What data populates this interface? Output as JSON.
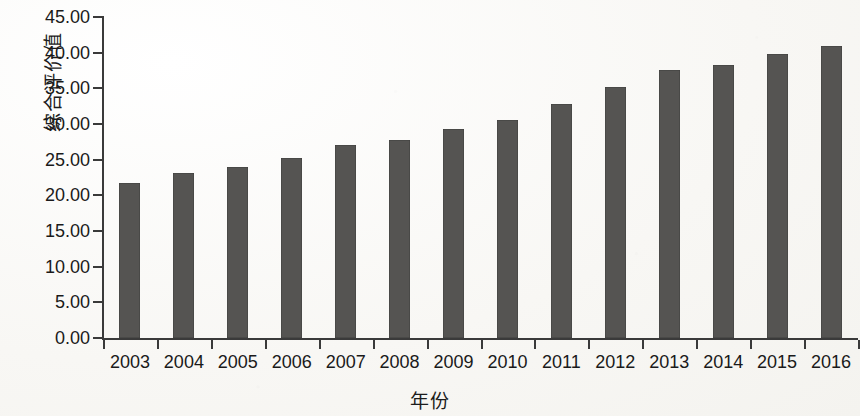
{
  "chart_data": {
    "type": "bar",
    "title": "",
    "xlabel": "年份",
    "ylabel": "综合评价值",
    "categories": [
      "2003",
      "2004",
      "2005",
      "2006",
      "2007",
      "2008",
      "2009",
      "2010",
      "2011",
      "2012",
      "2013",
      "2014",
      "2015",
      "2016"
    ],
    "values": [
      21.7,
      23.1,
      24.0,
      25.2,
      27.0,
      27.8,
      29.3,
      30.6,
      32.8,
      35.2,
      37.6,
      38.3,
      39.8,
      41.0
    ],
    "series": [
      {
        "name": "综合评价值",
        "values": [
          21.7,
          23.1,
          24.0,
          25.2,
          27.0,
          27.8,
          29.3,
          30.6,
          32.8,
          35.2,
          37.6,
          38.3,
          39.8,
          41.0
        ]
      }
    ],
    "ylim": [
      0,
      45
    ],
    "ytick_step": 5,
    "ytick_labels": [
      "0.00",
      "5.00",
      "10.00",
      "15.00",
      "20.00",
      "25.00",
      "30.00",
      "35.00",
      "40.00",
      "45.00"
    ],
    "ytick_values": [
      0,
      5,
      10,
      15,
      20,
      25,
      30,
      35,
      40,
      45
    ],
    "grid": false,
    "legend": false,
    "legend_position": "none",
    "bar_color": "#555452",
    "axis_color": "#3a3a3a",
    "background_color": "#fbfaf8",
    "text_color": "#1a1a1a"
  }
}
